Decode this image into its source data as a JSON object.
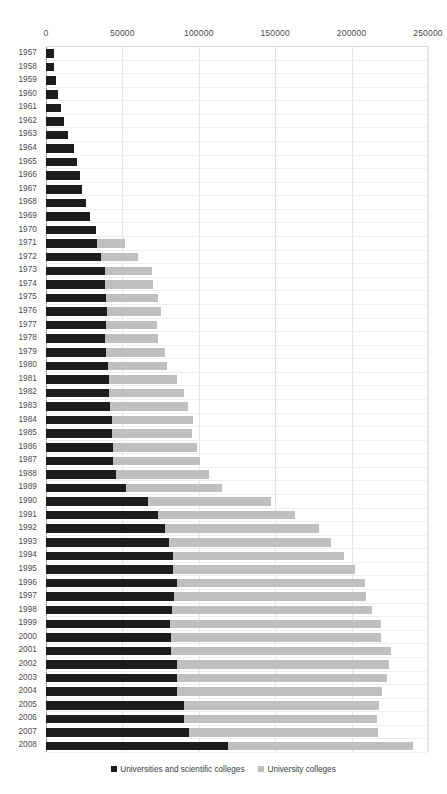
{
  "chart_data": {
    "type": "bar",
    "orientation": "horizontal",
    "stacked": true,
    "title": "",
    "xlabel": "",
    "ylabel": "",
    "xlim": [
      0,
      250000
    ],
    "xticks": [
      0,
      50000,
      100000,
      150000,
      200000,
      250000
    ],
    "xtick_labels": [
      "0",
      "50000",
      "100000",
      "150000",
      "200000",
      "250000"
    ],
    "grid": true,
    "legend_position": "bottom",
    "categories": [
      "1957",
      "1958",
      "1959",
      "1960",
      "1961",
      "1962",
      "1963",
      "1964",
      "1965",
      "1966",
      "1967",
      "1968",
      "1969",
      "1970",
      "1971",
      "1972",
      "1973",
      "1974",
      "1975",
      "1976",
      "1977",
      "1978",
      "1979",
      "1980",
      "1981",
      "1982",
      "1983",
      "1984",
      "1985",
      "1986",
      "1987",
      "1988",
      "1989",
      "1990",
      "1991",
      "1992",
      "1993",
      "1994",
      "1995",
      "1996",
      "1997",
      "1998",
      "1999",
      "2000",
      "2001",
      "2002",
      "2003",
      "2004",
      "2005",
      "2006",
      "2007",
      "2008"
    ],
    "series": [
      {
        "name": "Universities and scientific colleges",
        "color": "#1c1c1c",
        "values": [
          5000,
          5500,
          6500,
          8000,
          9500,
          11500,
          14500,
          18000,
          20500,
          22500,
          23500,
          26500,
          29000,
          32500,
          33500,
          36000,
          38500,
          38500,
          39500,
          40000,
          39500,
          38500,
          39500,
          40500,
          41500,
          41500,
          42000,
          43000,
          43000,
          44000,
          44000,
          46000,
          52500,
          67000,
          73000,
          78000,
          80500,
          83000,
          83000,
          85500,
          83500,
          82500,
          81000,
          82000,
          82000,
          86000,
          85500,
          86000,
          90000,
          90500,
          93500,
          119000
        ]
      },
      {
        "name": "University colleges",
        "color": "#bfbfbf",
        "values": [
          0,
          0,
          0,
          0,
          0,
          0,
          0,
          0,
          0,
          0,
          0,
          0,
          0,
          0,
          18500,
          24500,
          31000,
          31500,
          34000,
          35000,
          33000,
          34500,
          38500,
          39000,
          44500,
          48500,
          51000,
          53500,
          52500,
          55000,
          56500,
          61000,
          62500,
          80000,
          90000,
          101000,
          106000,
          112000,
          119000,
          123000,
          126000,
          131000,
          138000,
          137000,
          144000,
          138500,
          137500,
          134000,
          128000,
          126000,
          124000,
          121000
        ]
      }
    ],
    "legend": [
      {
        "label": "Universities and scientific colleges",
        "color": "#1c1c1c"
      },
      {
        "label": "University colleges",
        "color": "#bfbfbf"
      }
    ]
  }
}
